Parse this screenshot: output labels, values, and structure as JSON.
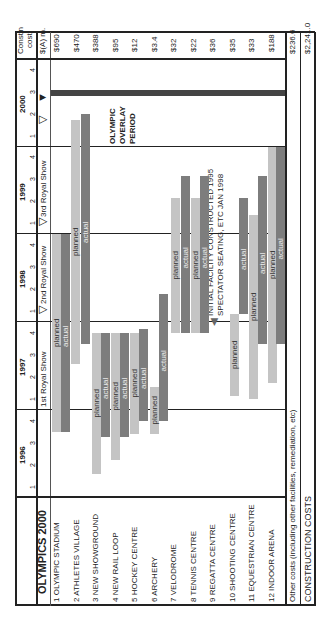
{
  "header": {
    "title": "OLYMPICS 2000",
    "cost_header_1": "Const'n",
    "cost_header_2": "cost",
    "cost_header_3": "$(A) m.",
    "years": [
      "1996",
      "1997",
      "1998",
      "1999",
      "2000"
    ],
    "quarters": [
      "1",
      "2",
      "3",
      "4"
    ],
    "shows": [
      "1st Royal Show",
      "2nd Royal Show",
      "3rd Royal Show"
    ]
  },
  "rows": [
    {
      "label": "1 OLYMPIC STADIUM",
      "cost": "$690"
    },
    {
      "label": "2  ATHLETES VILLAGE",
      "cost": "$470"
    },
    {
      "label": "3  NEW SHOWGROUND",
      "cost": "$388"
    },
    {
      "label": "4  NEW RAIL LOOP",
      "cost": "$95"
    },
    {
      "label": "5  HOCKEY CENTRE",
      "cost": "$12"
    },
    {
      "label": "6  ARCHERY",
      "cost": "$3.4"
    },
    {
      "label": "7  VELODROME",
      "cost": "$32"
    },
    {
      "label": "8  TENNIS CENTRE",
      "cost": "$22"
    },
    {
      "label": "9  REGATTA CENTRE",
      "cost": "$36"
    },
    {
      "label": "10  SHOOTING CENTRE",
      "cost": "$35"
    },
    {
      "label": "11  EQUESTRIAN CENTRE",
      "cost": "$33"
    },
    {
      "label": "12  INDOOR ARENA",
      "cost": "$188"
    }
  ],
  "footer": {
    "other_label": "Other costs (including other facilities, remediation, etc)",
    "other_cost": "$236.6",
    "total_label": "CONSTRUCTION COSTS",
    "total_cost": "$2,241.0"
  },
  "annotations": {
    "overlay": [
      "OLYMPIC",
      "OVERLAY",
      "PERIOD"
    ],
    "note_1": "INITIAL FACILITY CONSTRUCTED 1995",
    "note_2": "SPECTATOR SEATING, ETC JAN 1998"
  },
  "labels": {
    "planned": "planned",
    "actual": "actual"
  },
  "colors": {
    "planned": "#c4c4c4",
    "actual": "#7d7d7d",
    "olympic_bar": "#444444"
  },
  "chart_data": {
    "type": "gantt",
    "title": "OLYMPICS 2000",
    "x_axis": "Quarter (1996 Q1 – 2000 Q4)",
    "time_unit": "quarter",
    "milestones": [
      {
        "label": "1st Royal Show",
        "at": "1997 Q1"
      },
      {
        "label": "2nd Royal Show",
        "at": "1998 Q2"
      },
      {
        "label": "3rd Royal Show",
        "at": "1999 Q2"
      },
      {
        "label": "Olympic overlay start",
        "at": "2000 Q2"
      },
      {
        "label": "Olympics",
        "at": "2000 Q3"
      }
    ],
    "series": [
      {
        "facility": "OLYMPIC STADIUM",
        "cost_AUD_m": 690,
        "planned": [
          "1996 Q4",
          "1999 Q2"
        ],
        "actual": [
          "1996 Q4",
          "1999 Q2"
        ]
      },
      {
        "facility": "ATHLETES VILLAGE",
        "cost_AUD_m": 470,
        "planned": [
          "1997 Q2",
          "2000 Q1"
        ],
        "actual": [
          "1997 Q4",
          "2000 Q1"
        ]
      },
      {
        "facility": "NEW SHOWGROUND",
        "cost_AUD_m": 388,
        "planned": [
          "1996 Q2",
          "1998 Q1"
        ],
        "actual": [
          "1996 Q4",
          "1998 Q1"
        ]
      },
      {
        "facility": "NEW RAIL LOOP",
        "cost_AUD_m": 95,
        "planned": [
          "1996 Q3",
          "1998 Q1"
        ],
        "actual": [
          "1996 Q4",
          "1998 Q1"
        ]
      },
      {
        "facility": "HOCKEY CENTRE",
        "cost_AUD_m": 12,
        "planned": [
          "1996 Q4",
          "1998 Q1"
        ],
        "actual": [
          "1997 Q2",
          "1998 Q1"
        ]
      },
      {
        "facility": "ARCHERY",
        "cost_AUD_m": 3.4,
        "planned": [
          "1996 Q4",
          "1997 Q2"
        ],
        "actual": [
          "1997 Q2",
          "1998 Q2"
        ]
      },
      {
        "facility": "VELODROME",
        "cost_AUD_m": 32,
        "planned": [
          "1998 Q1",
          "1999 Q3"
        ],
        "actual": [
          "1998 Q1",
          "1999 Q4"
        ]
      },
      {
        "facility": "TENNIS CENTRE",
        "cost_AUD_m": 22,
        "planned": [
          "1998 Q1",
          "1999 Q3"
        ],
        "actual": [
          "1998 Q1",
          "1999 Q4"
        ]
      },
      {
        "facility": "REGATTA CENTRE",
        "cost_AUD_m": 36,
        "planned": null,
        "actual": null,
        "note": "Initial facility constructed 1995; spectator seating etc Jan 1998"
      },
      {
        "facility": "SHOOTING CENTRE",
        "cost_AUD_m": 35,
        "planned": [
          "1997 Q1",
          "1998 Q1"
        ],
        "actual": [
          "1998 Q1",
          "1999 Q3"
        ]
      },
      {
        "facility": "EQUESTRIAN CENTRE",
        "cost_AUD_m": 33,
        "planned": [
          "1997 Q1",
          "1999 Q2"
        ],
        "actual": [
          "1997 Q4",
          "1999 Q4"
        ]
      },
      {
        "facility": "INDOOR ARENA",
        "cost_AUD_m": 188,
        "planned": [
          "1997 Q3",
          "2000 Q1"
        ],
        "actual": [
          "1997 Q4",
          "2000 Q1"
        ]
      }
    ],
    "totals": {
      "other_costs_AUD_m": 236.6,
      "construction_costs_AUD_m": 2241.0
    }
  }
}
